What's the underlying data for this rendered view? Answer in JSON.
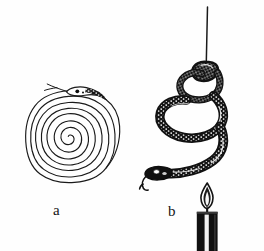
{
  "figure": {
    "kind": "line-art-illustration",
    "background_color": "#fefefe",
    "ink_color": "#1a1a1a",
    "panels": [
      {
        "id": "a",
        "label": "a",
        "label_x": 53,
        "label_y": 203,
        "caption_text": "a",
        "content": "flat paper snake cut as a spiral, head with eye and forked tongue at top",
        "spiral": {
          "center_x": 68,
          "center_y": 137,
          "outer_radius": 47,
          "turns": 4.5,
          "line_width": 1.1
        },
        "head": {
          "center_x": 78,
          "center_y": 92,
          "eye_color": "#000000",
          "tongue": "forked"
        }
      },
      {
        "id": "b",
        "label": "b",
        "label_x": 168,
        "label_y": 204,
        "caption_text": "b",
        "content": "spiral snake hanging from a thread above a lit candle, coiled into a helix by rising hot air",
        "thread": {
          "x": 207,
          "top_y": 8,
          "bottom_y": 62,
          "line_width": 1.4
        },
        "snake": {
          "body_color": "#141414",
          "scale_speckle_color": "#ffffff",
          "head_x": 158,
          "head_y": 172,
          "eye_color": "#ffffff",
          "tongue": "forked"
        },
        "candle": {
          "body_x": 197,
          "body_y": 212,
          "body_width": 21,
          "body_height": 39,
          "body_color": "#111111",
          "highlight_color": "#f2f2f2",
          "flame_color": "#1a1a1a",
          "flame_center_x": 207,
          "flame_top_y": 183,
          "wick_visible": true
        }
      }
    ]
  }
}
